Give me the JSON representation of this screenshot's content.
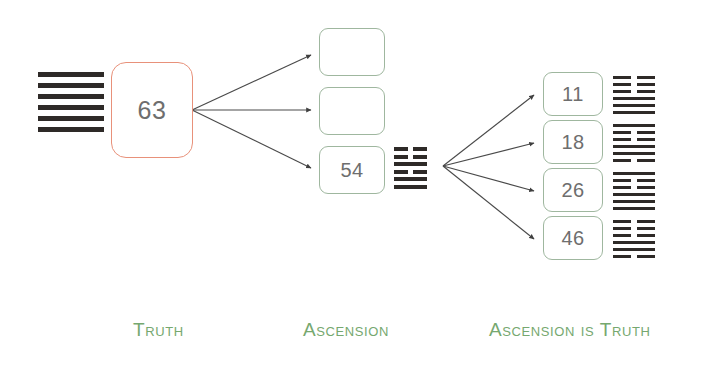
{
  "diagram": {
    "type": "tree",
    "background_color": "#ffffff",
    "accent_color": "#e8917a",
    "node_border_color": "#9fb79f",
    "caption_color": "#76a86f",
    "line_color": "#4a4a4a",
    "hexagram_color": "#2e2a28"
  },
  "root": {
    "hexagram_name": "hexagram-63",
    "hexagram_lines": [
      "yang",
      "yang",
      "yang",
      "yang",
      "yang",
      "yang"
    ]
  },
  "nodes": {
    "root_node": {
      "label": "63"
    },
    "level1": [
      {
        "label": "",
        "empty": true
      },
      {
        "label": "",
        "empty": true
      },
      {
        "label": "54",
        "empty": false
      }
    ],
    "level2": [
      {
        "label": "11"
      },
      {
        "label": "18"
      },
      {
        "label": "26"
      },
      {
        "label": "46"
      }
    ]
  },
  "hexagrams": {
    "hex_54": {
      "name": "hexagram-54",
      "lines": [
        "yin",
        "yin",
        "yang",
        "yin",
        "yang",
        "yang"
      ]
    },
    "hex_11": {
      "name": "hexagram-11",
      "lines": [
        "yin",
        "yin",
        "yin",
        "yang",
        "yang",
        "yang"
      ]
    },
    "hex_18": {
      "name": "hexagram-18",
      "lines": [
        "yang",
        "yin",
        "yin",
        "yang",
        "yang",
        "yin"
      ]
    },
    "hex_26": {
      "name": "hexagram-26",
      "lines": [
        "yang",
        "yin",
        "yin",
        "yang",
        "yang",
        "yang"
      ]
    },
    "hex_46": {
      "name": "hexagram-46",
      "lines": [
        "yin",
        "yin",
        "yin",
        "yang",
        "yang",
        "yin"
      ]
    }
  },
  "captions": {
    "truth": "Truth",
    "ascension": "Ascension",
    "ascension_is_truth": "Ascension is Truth"
  }
}
